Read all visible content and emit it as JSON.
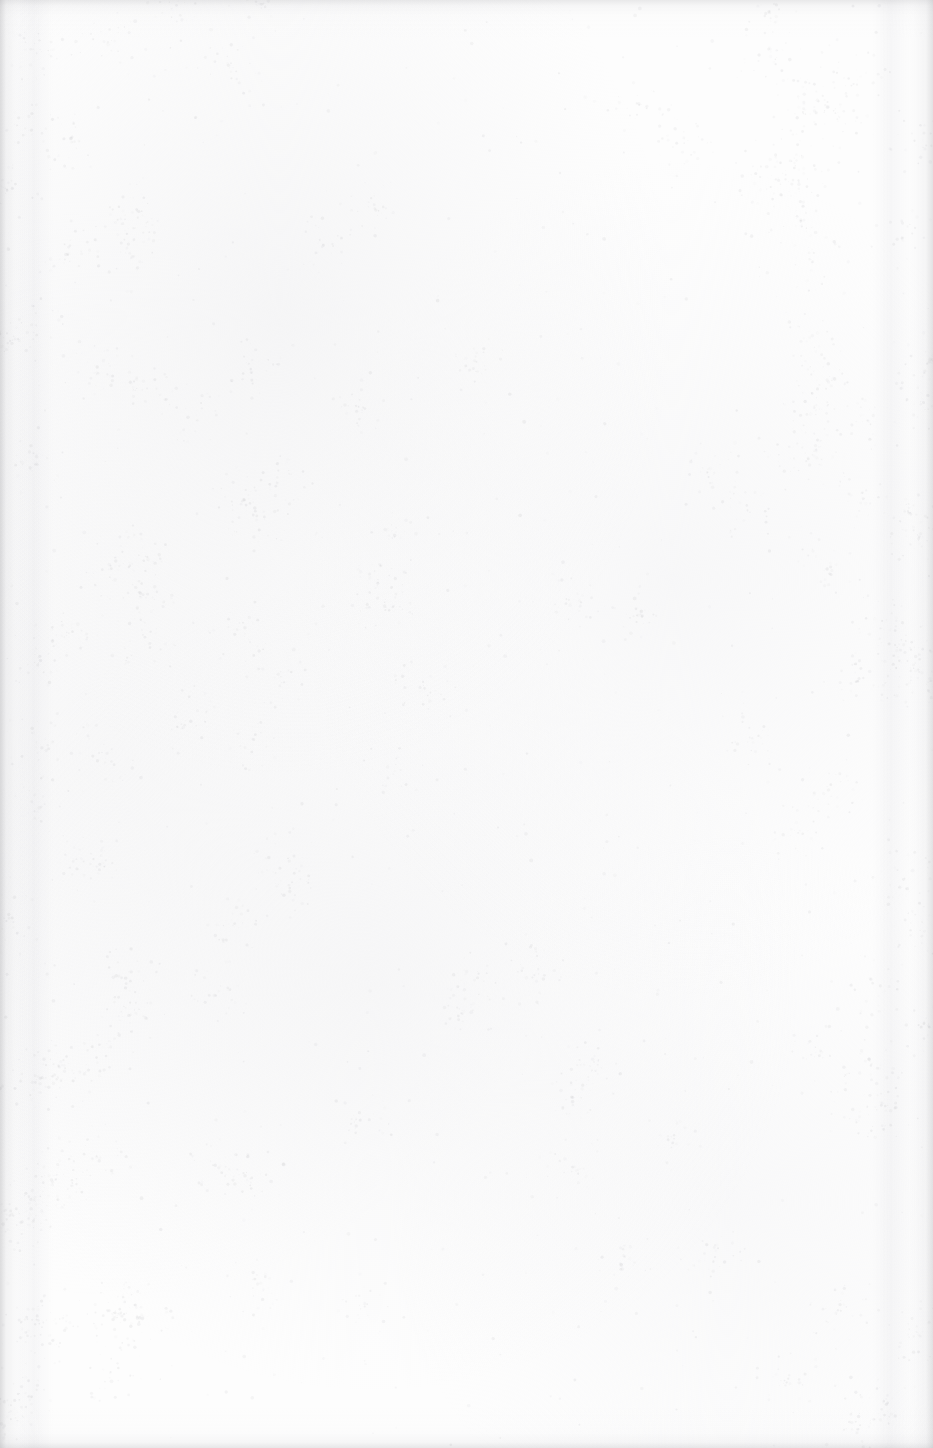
{
  "document": {
    "page_kind": "blank-scanned-page",
    "orientation": "portrait",
    "width_px": 933,
    "height_px": 1448,
    "visible_text": "",
    "has_text": false,
    "has_figures": false,
    "has_tables": false,
    "has_page_number": false,
    "has_header": false,
    "has_footer": false,
    "has_rules_or_borders": false
  },
  "appearance": {
    "paper_color": "#fdfdfd",
    "base_white": "#ffffff",
    "grain_color": "#b9b9bd",
    "mottle_color": "#f6f6f7",
    "edge_shadow_color": "#a8a8ac",
    "gutter_band_color": "#e2e2e6"
  },
  "grain": {
    "speckle_density": 0.055,
    "speckle_min_alpha": 0.04,
    "speckle_max_alpha": 0.3,
    "speckle_max_radius": 1.6,
    "cluster_count": 140,
    "cluster_radius": 34,
    "cluster_speckles": 26,
    "random_seed": 20240917
  }
}
